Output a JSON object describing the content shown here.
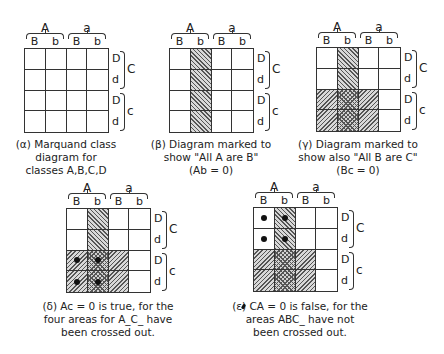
{
  "labels": {
    "col_groups": [
      "A",
      "a"
    ],
    "col_subs": [
      "B",
      "b",
      "B",
      "b"
    ],
    "row_subs": [
      "D",
      "d",
      "D",
      "d"
    ],
    "row_groups": [
      "C",
      "c"
    ]
  },
  "panels": [
    {
      "id": "alpha",
      "caption_lines": [
        "(α) Marquand class",
        "diagram for",
        "classes A,B,C,D"
      ],
      "cells": [
        [
          "",
          "",
          "",
          ""
        ],
        [
          "",
          "",
          "",
          ""
        ],
        [
          "",
          "",
          "",
          ""
        ],
        [
          "",
          "",
          "",
          ""
        ]
      ],
      "dots": []
    },
    {
      "id": "beta",
      "caption_lines": [
        "(β) Diagram marked to",
        "show \"All A are B\"",
        "(Ab = 0)"
      ],
      "shading": "column Ab hatched (Ab=0)",
      "cells": [
        [
          "",
          "h2",
          "",
          ""
        ],
        [
          "",
          "h2",
          "",
          ""
        ],
        [
          "",
          "h2",
          "",
          ""
        ],
        [
          "",
          "h2",
          "",
          ""
        ]
      ],
      "dots": []
    },
    {
      "id": "gamma",
      "caption_lines": [
        "(γ) Diagram marked to",
        "show also \"All B are C\"",
        "(Bc = 0)"
      ],
      "shading": "Ab hatched plus Bc hatched",
      "cells": [
        [
          "",
          "h2",
          "",
          ""
        ],
        [
          "",
          "h2",
          "",
          ""
        ],
        [
          "h1",
          "h12",
          "h1",
          ""
        ],
        [
          "h1",
          "h12",
          "h1",
          ""
        ]
      ],
      "dots": []
    },
    {
      "id": "delta",
      "caption_lines": [
        "(δ) Ac = 0 is true, for the",
        "four areas for A_C_ have",
        "been crossed out."
      ],
      "cells": [
        [
          "",
          "h2",
          "",
          ""
        ],
        [
          "",
          "h2",
          "",
          ""
        ],
        [
          "h1",
          "h12",
          "h1",
          ""
        ],
        [
          "h1",
          "h12",
          "h1",
          ""
        ]
      ],
      "dots": [
        [
          2,
          0
        ],
        [
          2,
          1
        ],
        [
          3,
          0
        ],
        [
          3,
          1
        ]
      ]
    },
    {
      "id": "epsilon",
      "caption_lines": [
        "(ε) CA = 0 is false, for the",
        "areas ABC_ have not",
        "been crossed out."
      ],
      "cells": [
        [
          "",
          "h2",
          "",
          ""
        ],
        [
          "",
          "h2",
          "",
          ""
        ],
        [
          "h1",
          "h12",
          "h1",
          ""
        ],
        [
          "h1",
          "h12",
          "h1",
          ""
        ]
      ],
      "dots": [
        [
          0,
          0
        ],
        [
          0,
          1
        ],
        [
          1,
          0
        ],
        [
          1,
          1
        ]
      ]
    }
  ],
  "colors": {
    "line": "#333333",
    "hatch": "#555555",
    "background": "#ffffff"
  }
}
